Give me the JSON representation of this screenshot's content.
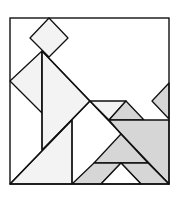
{
  "diagram": {
    "type": "tangram-puzzle",
    "width": 180,
    "height": 199,
    "colors": {
      "background": "#ffffff",
      "stroke": "#111111",
      "light_fill": "#f3f3f3",
      "gray_fill": "#d6d6d6",
      "white_fill": "#ffffff"
    },
    "frame": {
      "x": 10,
      "y": 18,
      "width": 159,
      "height": 166
    },
    "pieces": [
      {
        "name": "square-diamond",
        "fill": "light",
        "points": [
          [
            49,
            18
          ],
          [
            68,
            38
          ],
          [
            49,
            57
          ],
          [
            30,
            38
          ]
        ]
      },
      {
        "name": "left-medium-triangle",
        "fill": "light",
        "points": [
          [
            42,
            51
          ],
          [
            10,
            81
          ],
          [
            42,
            113
          ]
        ]
      },
      {
        "name": "large-triangle-upper",
        "fill": "light",
        "points": [
          [
            42,
            51
          ],
          [
            90,
            101
          ],
          [
            42,
            150
          ]
        ]
      },
      {
        "name": "large-triangle-lower",
        "fill": "light",
        "points": [
          [
            10,
            184
          ],
          [
            72,
            120
          ],
          [
            72,
            184
          ]
        ]
      },
      {
        "name": "parallelogram-top",
        "fill": "light",
        "points": [
          [
            90,
            101
          ],
          [
            126,
            101
          ],
          [
            109,
            120
          ]
        ]
      },
      {
        "name": "gray-small-triangle-top",
        "fill": "gray",
        "points": [
          [
            126,
            101
          ],
          [
            144,
            120
          ],
          [
            109,
            120
          ]
        ]
      },
      {
        "name": "gray-right-notch-triangle",
        "fill": "gray",
        "points": [
          [
            169,
            83
          ],
          [
            169,
            119
          ],
          [
            152,
            101
          ]
        ]
      },
      {
        "name": "gray-large-square-region",
        "fill": "gray",
        "points": [
          [
            109,
            120
          ],
          [
            169,
            120
          ],
          [
            169,
            184
          ],
          [
            148,
            163
          ],
          [
            121,
            134
          ]
        ]
      },
      {
        "name": "gray-middle-triangle",
        "fill": "gray",
        "points": [
          [
            121,
            134
          ],
          [
            148,
            163
          ],
          [
            94,
            163
          ]
        ]
      },
      {
        "name": "gray-bottom-left-parallelogram",
        "fill": "gray",
        "points": [
          [
            72,
            184
          ],
          [
            94,
            163
          ],
          [
            121,
            163
          ],
          [
            101,
            184
          ]
        ]
      },
      {
        "name": "gray-bottom-right-parallelogram",
        "fill": "gray",
        "points": [
          [
            121,
            163
          ],
          [
            148,
            163
          ],
          [
            169,
            184
          ],
          [
            141,
            184
          ]
        ]
      },
      {
        "name": "white-bottom-triangle",
        "fill": "white",
        "points": [
          [
            121,
            163
          ],
          [
            141,
            184
          ],
          [
            101,
            184
          ]
        ]
      }
    ],
    "lines": [
      {
        "name": "vertical-line-left",
        "from": [
          42,
          51
        ],
        "to": [
          42,
          150
        ]
      },
      {
        "name": "vertical-line-middle",
        "from": [
          72,
          120
        ],
        "to": [
          72,
          184
        ]
      },
      {
        "name": "big-diagonal",
        "from": [
          10,
          184
        ],
        "to": [
          90,
          101
        ]
      },
      {
        "name": "upper-diagonal",
        "from": [
          42,
          51
        ],
        "to": [
          169,
          184
        ]
      }
    ]
  }
}
